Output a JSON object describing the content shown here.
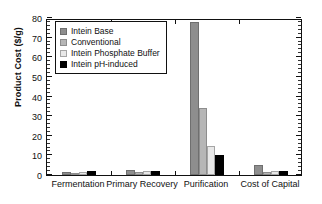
{
  "chart_data": {
    "type": "bar",
    "title": "",
    "xlabel": "",
    "ylabel": "Product Cost ($/g)",
    "ylim": [
      0,
      80
    ],
    "ytick_labels": [
      "0",
      "10",
      "20",
      "30",
      "40",
      "50",
      "60",
      "70",
      "80"
    ],
    "ytick_values": [
      0,
      10,
      20,
      30,
      40,
      50,
      60,
      70,
      80
    ],
    "minor_tick_step": 2,
    "grid": false,
    "legend_position": "upper left",
    "categories": [
      "Fermentation",
      "Primary Recovery",
      "Purification",
      "Cost of Capital"
    ],
    "series": [
      {
        "name": "Intein Base",
        "color": "#8e8e8e",
        "values": [
          1.6,
          2.7,
          77.8,
          5.3
        ]
      },
      {
        "name": "Conventional",
        "color": "#b6b6b6",
        "values": [
          1.1,
          1.3,
          34.0,
          1.5
        ]
      },
      {
        "name": "Intein Phosphate Buffer",
        "color": "#e8e8e8",
        "values": [
          1.5,
          2.1,
          14.7,
          2.0
        ]
      },
      {
        "name": "Intein pH-induced",
        "color": "#000000",
        "values": [
          2.0,
          2.3,
          10.0,
          2.1
        ]
      }
    ]
  },
  "legend": {
    "items": [
      {
        "label": "Intein Base"
      },
      {
        "label": "Conventional"
      },
      {
        "label": "Intein Phosphate Buffer"
      },
      {
        "label": "Intein pH-induced"
      }
    ]
  }
}
